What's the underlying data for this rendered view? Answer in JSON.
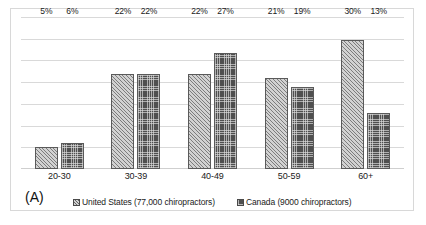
{
  "panel": {
    "label": "(A)"
  },
  "legend": {
    "position": "bottom",
    "items": [
      {
        "swatch": "us",
        "label": "United States (77,000 chiropractors)"
      },
      {
        "swatch": "ca",
        "label": "Canada (9000 chiropractors)"
      }
    ]
  },
  "chart_data": {
    "type": "bar",
    "title": "",
    "subtitle": "",
    "xlabel": "",
    "ylabel": "",
    "ylim": [
      0,
      35
    ],
    "grid": true,
    "gridline_count": 7,
    "yaxis_tick_labels_visible": false,
    "legend_position": "bottom",
    "value_format": "percent",
    "categories": [
      "20-30",
      "30-39",
      "40-49",
      "50-59",
      "60+"
    ],
    "series": [
      {
        "name": "United States (77,000 chiropractors)",
        "short_name": "United States",
        "values": [
          5,
          22,
          22,
          21,
          30
        ],
        "labels": [
          "5%",
          "22%",
          "22%",
          "21%",
          "30%"
        ],
        "fill": "diagonal-hatch",
        "color": "#d2d2d2"
      },
      {
        "name": "Canada (9000 chiropractors)",
        "short_name": "Canada",
        "values": [
          6,
          22,
          27,
          19,
          13
        ],
        "labels": [
          "6%",
          "22%",
          "27%",
          "19%",
          "13%"
        ],
        "fill": "checkered",
        "color": "#4f4f4f"
      }
    ],
    "annotations": [
      "(A)"
    ]
  }
}
